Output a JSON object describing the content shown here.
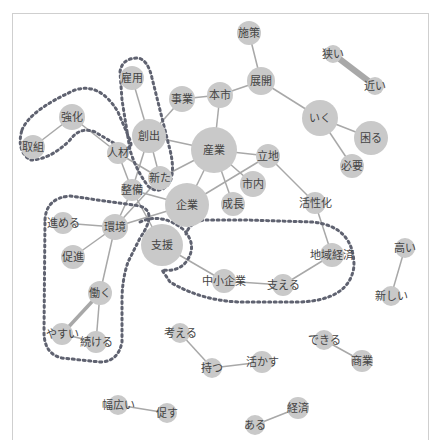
{
  "diagram": {
    "type": "co-occurrence network",
    "colors": {
      "node": "#c9c9c9",
      "edge": "#a8a8a8",
      "label": "#444444",
      "community_outline": "#5f6270",
      "frame": "#cfcfcf"
    },
    "nodes": [
      {
        "id": "shisaku",
        "label": "施策",
        "x": 249,
        "y": 33,
        "r": 12
      },
      {
        "id": "tenkai",
        "label": "展開",
        "x": 261,
        "y": 81,
        "r": 14
      },
      {
        "id": "honshi",
        "label": "本市",
        "x": 220,
        "y": 95,
        "r": 13
      },
      {
        "id": "jigyou",
        "label": "事業",
        "x": 182,
        "y": 99,
        "r": 13
      },
      {
        "id": "koyou",
        "label": "雇用",
        "x": 132,
        "y": 78,
        "r": 12
      },
      {
        "id": "kyouka",
        "label": "強化",
        "x": 72,
        "y": 117,
        "r": 13
      },
      {
        "id": "torikumi",
        "label": "取組",
        "x": 33,
        "y": 147,
        "r": 12
      },
      {
        "id": "jinzai",
        "label": "人材",
        "x": 118,
        "y": 153,
        "r": 11
      },
      {
        "id": "soushutsu",
        "label": "創出",
        "x": 149,
        "y": 136,
        "r": 17
      },
      {
        "id": "sangyou",
        "label": "産業",
        "x": 214,
        "y": 150,
        "r": 23
      },
      {
        "id": "ritchi",
        "label": "立地",
        "x": 268,
        "y": 156,
        "r": 12
      },
      {
        "id": "shinai",
        "label": "市内",
        "x": 253,
        "y": 184,
        "r": 13
      },
      {
        "id": "seichou",
        "label": "成長",
        "x": 233,
        "y": 204,
        "r": 12
      },
      {
        "id": "kigyou",
        "label": "企業",
        "x": 187,
        "y": 205,
        "r": 22
      },
      {
        "id": "arata",
        "label": "新た",
        "x": 160,
        "y": 178,
        "r": 12
      },
      {
        "id": "seibi",
        "label": "整備",
        "x": 132,
        "y": 190,
        "r": 11
      },
      {
        "id": "kankyou",
        "label": "環境",
        "x": 115,
        "y": 227,
        "r": 13
      },
      {
        "id": "susumeru",
        "label": "進める",
        "x": 63,
        "y": 223,
        "r": 11
      },
      {
        "id": "sokushin",
        "label": "促進",
        "x": 73,
        "y": 257,
        "r": 12
      },
      {
        "id": "shien",
        "label": "支援",
        "x": 162,
        "y": 245,
        "r": 21
      },
      {
        "id": "hataraku",
        "label": "働く",
        "x": 100,
        "y": 293,
        "r": 12
      },
      {
        "id": "yasui",
        "label": "やすい",
        "x": 62,
        "y": 334,
        "r": 11
      },
      {
        "id": "tsuzukeru",
        "label": "続ける",
        "x": 96,
        "y": 342,
        "r": 11
      },
      {
        "id": "chuushou",
        "label": "中小企業",
        "x": 224,
        "y": 281,
        "r": 12
      },
      {
        "id": "sasaeru",
        "label": "支える",
        "x": 283,
        "y": 285,
        "r": 11
      },
      {
        "id": "chiiki",
        "label": "地域経済",
        "x": 332,
        "y": 255,
        "r": 12
      },
      {
        "id": "kasseika",
        "label": "活性化",
        "x": 315,
        "y": 203,
        "r": 11
      },
      {
        "id": "iku",
        "label": "いく",
        "x": 320,
        "y": 118,
        "r": 18
      },
      {
        "id": "komaru",
        "label": "困る",
        "x": 371,
        "y": 138,
        "r": 17
      },
      {
        "id": "hitsuyou",
        "label": "必要",
        "x": 352,
        "y": 166,
        "r": 12
      },
      {
        "id": "semai",
        "label": "狭い",
        "x": 333,
        "y": 54,
        "r": 9
      },
      {
        "id": "chikai",
        "label": "近い",
        "x": 375,
        "y": 86,
        "r": 9
      },
      {
        "id": "takai",
        "label": "高い",
        "x": 405,
        "y": 248,
        "r": 10
      },
      {
        "id": "atarashii",
        "label": "新しい",
        "x": 391,
        "y": 296,
        "r": 10
      },
      {
        "id": "kangaeru",
        "label": "考える",
        "x": 180,
        "y": 333,
        "r": 10
      },
      {
        "id": "motsu",
        "label": "持つ",
        "x": 212,
        "y": 368,
        "r": 10
      },
      {
        "id": "ikasu",
        "label": "活かす",
        "x": 262,
        "y": 362,
        "r": 11
      },
      {
        "id": "dekiru",
        "label": "できる",
        "x": 324,
        "y": 340,
        "r": 10
      },
      {
        "id": "shougyou",
        "label": "商業",
        "x": 362,
        "y": 361,
        "r": 11
      },
      {
        "id": "habahiroi",
        "label": "幅広い",
        "x": 118,
        "y": 405,
        "r": 10
      },
      {
        "id": "unagasu",
        "label": "促す",
        "x": 167,
        "y": 413,
        "r": 10
      },
      {
        "id": "keizai",
        "label": "経済",
        "x": 298,
        "y": 408,
        "r": 11
      },
      {
        "id": "aru",
        "label": "ある",
        "x": 255,
        "y": 425,
        "r": 10
      }
    ],
    "edges": [
      {
        "from": "shisaku",
        "to": "tenkai",
        "w": 1.5
      },
      {
        "from": "tenkai",
        "to": "honshi",
        "w": 1.5
      },
      {
        "from": "tenkai",
        "to": "iku",
        "w": 1.5
      },
      {
        "from": "honshi",
        "to": "jigyou",
        "w": 1.5
      },
      {
        "from": "honshi",
        "to": "sangyou",
        "w": 1.5
      },
      {
        "from": "jigyou",
        "to": "soushutsu",
        "w": 1.5
      },
      {
        "from": "koyou",
        "to": "soushutsu",
        "w": 1.5
      },
      {
        "from": "kyouka",
        "to": "torikumi",
        "w": 1.5
      },
      {
        "from": "kyouka",
        "to": "jinzai",
        "w": 1.5
      },
      {
        "from": "jinzai",
        "to": "seibi",
        "w": 1.5
      },
      {
        "from": "jinzai",
        "to": "arata",
        "w": 1.5
      },
      {
        "from": "soushutsu",
        "to": "sangyou",
        "w": 1.5
      },
      {
        "from": "soushutsu",
        "to": "seibi",
        "w": 1.5
      },
      {
        "from": "soushutsu",
        "to": "arata",
        "w": 1.5
      },
      {
        "from": "sangyou",
        "to": "ritchi",
        "w": 1.5
      },
      {
        "from": "sangyou",
        "to": "seichou",
        "w": 1.5
      },
      {
        "from": "sangyou",
        "to": "kigyou",
        "w": 1.5
      },
      {
        "from": "sangyou",
        "to": "shinai",
        "w": 1.5
      },
      {
        "from": "sangyou",
        "to": "arata",
        "w": 1.5
      },
      {
        "from": "ritchi",
        "to": "kigyou",
        "w": 1.5
      },
      {
        "from": "ritchi",
        "to": "kasseika",
        "w": 1.5
      },
      {
        "from": "kigyou",
        "to": "kankyou",
        "w": 1.5
      },
      {
        "from": "kigyou",
        "to": "seibi",
        "w": 1.5
      },
      {
        "from": "arata",
        "to": "kankyou",
        "w": 1.5
      },
      {
        "from": "seibi",
        "to": "kankyou",
        "w": 1.5
      },
      {
        "from": "seibi",
        "to": "shien",
        "w": 1.5
      },
      {
        "from": "kankyou",
        "to": "susumeru",
        "w": 1.5
      },
      {
        "from": "kankyou",
        "to": "sokushin",
        "w": 1.5
      },
      {
        "from": "kankyou",
        "to": "hataraku",
        "w": 1.5
      },
      {
        "from": "hataraku",
        "to": "yasui",
        "w": 3.5
      },
      {
        "from": "hataraku",
        "to": "tsuzukeru",
        "w": 1.5
      },
      {
        "from": "yasui",
        "to": "tsuzukeru",
        "w": 1.5
      },
      {
        "from": "shien",
        "to": "chuushou",
        "w": 1.5
      },
      {
        "from": "chuushou",
        "to": "sasaeru",
        "w": 1.5
      },
      {
        "from": "sasaeru",
        "to": "chiiki",
        "w": 1.5
      },
      {
        "from": "chiiki",
        "to": "kasseika",
        "w": 1.5
      },
      {
        "from": "iku",
        "to": "komaru",
        "w": 1.5
      },
      {
        "from": "iku",
        "to": "hitsuyou",
        "w": 1.5
      },
      {
        "from": "semai",
        "to": "chikai",
        "w": 6
      },
      {
        "from": "takai",
        "to": "atarashii",
        "w": 1.5
      },
      {
        "from": "kangaeru",
        "to": "motsu",
        "w": 1.5
      },
      {
        "from": "motsu",
        "to": "ikasu",
        "w": 1.5
      },
      {
        "from": "dekiru",
        "to": "shougyou",
        "w": 1.5
      },
      {
        "from": "habahiroi",
        "to": "unagasu",
        "w": 1.5
      },
      {
        "from": "aru",
        "to": "keizai",
        "w": 1.5
      }
    ],
    "communities": [
      {
        "id": "kyouka-group",
        "path": "M 22 130 Q 30 110 75 90 Q 100 82 118 112 L 130 140 Q 134 150 122 148 L 95 132 Q 80 126 70 140 Q 50 160 30 160 Q 16 150 22 130 Z"
      },
      {
        "id": "koyou-group",
        "path": "M 120 72 Q 122 58 138 58 Q 148 60 152 78 L 170 150 Q 175 170 170 182 Q 160 196 148 186 Q 136 170 130 150 L 122 100 Z"
      },
      {
        "id": "kankyou-group",
        "path": "M 45 220 Q 46 198 70 196 L 140 206 Q 158 212 140 238 L 128 262 Q 122 280 122 300 L 122 342 Q 118 362 100 362 L 62 358 Q 44 354 44 332 Z"
      },
      {
        "id": "shien-group",
        "path": "M 140 222 Q 162 212 184 230 Q 198 246 186 262 Q 178 272 162 270 L 170 282 Q 200 300 238 302 L 300 302 Q 350 300 354 266 Q 354 226 312 222 L 246 220 L 204 220 Q 190 222 186 234"
      }
    ]
  }
}
